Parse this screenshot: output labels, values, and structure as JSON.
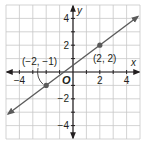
{
  "chart_data": {
    "type": "line",
    "title": "",
    "xlabel": "x",
    "ylabel": "y",
    "origin_label": "O",
    "xlim": [
      -5,
      5
    ],
    "ylim": [
      -5,
      5
    ],
    "grid": true,
    "x_ticks": [
      -4,
      2,
      4
    ],
    "x_tick_labels": [
      "−4",
      "2",
      "4"
    ],
    "y_ticks": [
      4,
      2,
      -2,
      -4
    ],
    "y_tick_labels": [
      "4",
      "2",
      "−2",
      "−4"
    ],
    "series": [
      {
        "name": "line",
        "slope": 0.75,
        "intercept": 0.5,
        "x": [
          -5,
          5
        ],
        "y": [
          -3.25,
          4.25
        ],
        "arrows_both_ends": true
      }
    ],
    "points": [
      {
        "x": -2,
        "y": -1,
        "label": "(−2, −1)"
      },
      {
        "x": 2,
        "y": 2,
        "label": "(2, 2)"
      }
    ],
    "colors": {
      "grid": "#c8c8c8",
      "axes": "#231f20",
      "line": "#5a5a5a",
      "points": "#5a5a5a"
    }
  }
}
